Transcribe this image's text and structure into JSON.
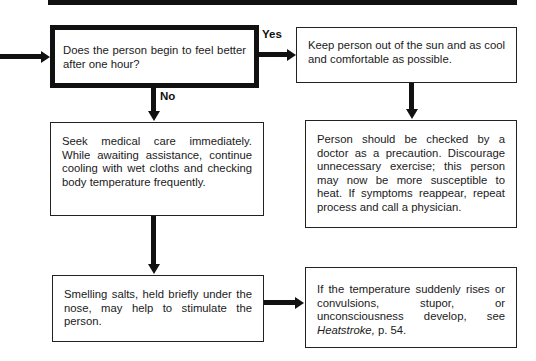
{
  "flowchart": {
    "decision": {
      "text": "Does the person begin to feel better after one hour?"
    },
    "branches": {
      "yes_label": "Yes",
      "no_label": "No"
    },
    "yes_path": {
      "step1": "Keep person out of the sun and as cool and comfortable as possible.",
      "step2": "Person should be checked by a doctor as a precaution. Discourage unnecessary exercise; this person may now be more susceptible to heat. If symptoms reappear, repeat process and call a physician."
    },
    "no_path": {
      "step1": "Seek medical care immediately. While awaiting assistance, continue cooling with wet cloths and checking body temperature frequently.",
      "step2": "Smelling salts, held briefly under the nose, may help to stimulate the person.",
      "step3_prefix": "If the temperature suddenly rises or convulsions, stupor, or unconsciousness develop, see ",
      "step3_ref": "Heatstroke,",
      "step3_suffix": " p. 54."
    }
  }
}
